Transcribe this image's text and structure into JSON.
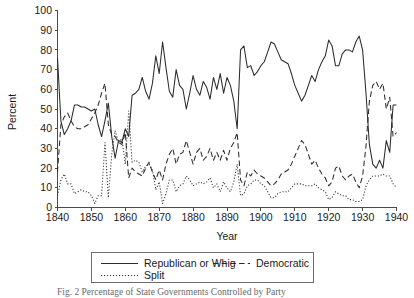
{
  "figure": {
    "caption_visible_fragment": "Fig. 2 Percentage of State Governments Controlled by Party"
  },
  "chart_data": {
    "type": "line",
    "title": "",
    "xlabel": "Year",
    "ylabel": "Percent",
    "xlim": [
      1840,
      1940
    ],
    "ylim": [
      0,
      100
    ],
    "grid": false,
    "legend_position": "below-axes",
    "xticks": [
      1840,
      1850,
      1860,
      1870,
      1880,
      1890,
      1900,
      1910,
      1920,
      1930,
      1940
    ],
    "yticks": [
      0,
      10,
      20,
      30,
      40,
      50,
      60,
      70,
      80,
      90,
      100
    ],
    "x": [
      1840,
      1841,
      1842,
      1843,
      1844,
      1845,
      1846,
      1847,
      1848,
      1849,
      1850,
      1851,
      1852,
      1853,
      1854,
      1855,
      1856,
      1857,
      1858,
      1859,
      1860,
      1861,
      1862,
      1863,
      1864,
      1865,
      1866,
      1867,
      1868,
      1869,
      1870,
      1871,
      1872,
      1873,
      1874,
      1875,
      1876,
      1877,
      1878,
      1879,
      1880,
      1881,
      1882,
      1883,
      1884,
      1885,
      1886,
      1887,
      1888,
      1889,
      1890,
      1891,
      1892,
      1893,
      1894,
      1895,
      1896,
      1897,
      1898,
      1899,
      1900,
      1901,
      1902,
      1903,
      1904,
      1905,
      1906,
      1907,
      1908,
      1909,
      1910,
      1911,
      1912,
      1913,
      1914,
      1915,
      1916,
      1917,
      1918,
      1919,
      1920,
      1921,
      1922,
      1923,
      1924,
      1925,
      1926,
      1927,
      1928,
      1929,
      1930,
      1931,
      1932,
      1933,
      1934,
      1935,
      1936,
      1937,
      1938,
      1939,
      1940
    ],
    "series": [
      {
        "name": "Republican or Whig",
        "style": "solid",
        "color": "#2b2b2b",
        "values": [
          76,
          44,
          37,
          40,
          44,
          52,
          52,
          51,
          51,
          50,
          49,
          50,
          42,
          36,
          44,
          53,
          36,
          25,
          34,
          33,
          40,
          36,
          57,
          58,
          60,
          66,
          59,
          55,
          63,
          77,
          68,
          84,
          71,
          59,
          56,
          70,
          62,
          60,
          50,
          58,
          67,
          60,
          57,
          64,
          61,
          55,
          66,
          60,
          68,
          58,
          66,
          62,
          54,
          40,
          80,
          82,
          71,
          72,
          67,
          69,
          72,
          74,
          79,
          84,
          83,
          79,
          75,
          74,
          73,
          68,
          62,
          58,
          54,
          57,
          62,
          67,
          64,
          70,
          74,
          77,
          85,
          82,
          72,
          72,
          78,
          80,
          80,
          79,
          84,
          87,
          80,
          58,
          32,
          22,
          20,
          24,
          20,
          34,
          28,
          52,
          52
        ]
      },
      {
        "name": "Democratic",
        "style": "dashed",
        "color": "#2b2b2b",
        "values": [
          18,
          42,
          46,
          48,
          44,
          41,
          40,
          40,
          41,
          42,
          45,
          48,
          52,
          58,
          63,
          42,
          37,
          36,
          33,
          32,
          38,
          15,
          20,
          18,
          17,
          16,
          20,
          23,
          18,
          14,
          19,
          14,
          22,
          27,
          30,
          22,
          27,
          28,
          34,
          28,
          22,
          28,
          30,
          24,
          26,
          30,
          24,
          28,
          24,
          29,
          24,
          30,
          33,
          38,
          14,
          11,
          18,
          16,
          19,
          17,
          16,
          15,
          13,
          11,
          12,
          14,
          17,
          18,
          19,
          22,
          26,
          30,
          34,
          32,
          27,
          22,
          24,
          20,
          17,
          15,
          11,
          13,
          20,
          21,
          16,
          14,
          16,
          17,
          13,
          10,
          16,
          31,
          54,
          62,
          64,
          60,
          63,
          50,
          56,
          36,
          38
        ]
      },
      {
        "name": "Split",
        "style": "dotted",
        "color": "#6f6f6f",
        "values": [
          6,
          14,
          17,
          12,
          12,
          7,
          8,
          9,
          8,
          8,
          6,
          2,
          6,
          6,
          33,
          5,
          27,
          39,
          33,
          35,
          22,
          49,
          23,
          24,
          23,
          18,
          21,
          22,
          19,
          9,
          13,
          2,
          7,
          14,
          14,
          8,
          11,
          12,
          16,
          14,
          11,
          12,
          13,
          12,
          13,
          15,
          10,
          12,
          8,
          13,
          10,
          8,
          13,
          22,
          6,
          7,
          11,
          12,
          14,
          14,
          12,
          11,
          8,
          5,
          5,
          7,
          8,
          8,
          8,
          10,
          12,
          12,
          12,
          11,
          11,
          11,
          12,
          10,
          9,
          8,
          4,
          5,
          8,
          7,
          6,
          6,
          4,
          4,
          3,
          3,
          4,
          11,
          14,
          16,
          16,
          16,
          17,
          16,
          16,
          12,
          10
        ]
      }
    ],
    "legend": [
      {
        "label": "Republican or Whig",
        "style": "solid"
      },
      {
        "label": "Democratic",
        "style": "dashed"
      },
      {
        "label": "Split",
        "style": "dotted"
      }
    ]
  }
}
